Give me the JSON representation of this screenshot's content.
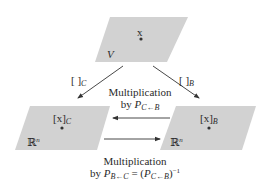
{
  "colors": {
    "plane_fill": "#d2d2d2",
    "arrow": "#333333",
    "text": "#2a2a2a",
    "background": "#ffffff"
  },
  "planes": {
    "top": {
      "space_label": "V",
      "vector_label": "x"
    },
    "left": {
      "space_label": "ℝ",
      "space_sup": "n",
      "vector_label": "[x]",
      "vector_sub": "C"
    },
    "right": {
      "space_label": "ℝ",
      "space_sup": "n",
      "vector_label": "[x]",
      "vector_sub": "B"
    }
  },
  "arrows": {
    "top_to_left": {
      "label": "[ ]",
      "sub": "C"
    },
    "top_to_right": {
      "label": "[ ]",
      "sub": "B"
    },
    "right_to_left": {
      "line1": "Multiplication",
      "line2_prefix": "by ",
      "matrix": "P",
      "matrix_sub": "C←B"
    },
    "left_to_right": {
      "line1": "Multiplication",
      "line2_prefix": "by ",
      "matrix": "P",
      "matrix_sub": "B←C",
      "equals": " = (",
      "matrix2": "P",
      "matrix2_sub": "C←B",
      "close": ")",
      "exponent": "−1"
    }
  }
}
